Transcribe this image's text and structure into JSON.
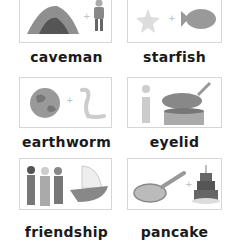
{
  "worksheet": {
    "cards": [
      {
        "word": "caveman",
        "parts": [
          "cave",
          "man"
        ]
      },
      {
        "word": "starfish",
        "parts": [
          "star",
          "fish"
        ]
      },
      {
        "word": "earthworm",
        "parts": [
          "earth",
          "worm"
        ]
      },
      {
        "word": "eyelid",
        "parts": [
          "eye (i)",
          "lid"
        ]
      },
      {
        "word": "friendship",
        "parts": [
          "friends",
          "ship"
        ]
      },
      {
        "word": "pancake",
        "parts": [
          "pan",
          "cake"
        ]
      }
    ],
    "plus_symbol": "+"
  }
}
